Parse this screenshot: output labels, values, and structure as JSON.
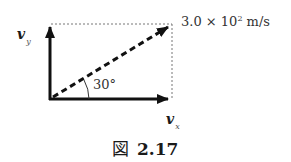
{
  "figure": {
    "caption_prefix": "図",
    "caption_number": "2.17",
    "labels": {
      "vy_symbol": "v",
      "vy_subscript": "y",
      "vx_symbol": "v",
      "vx_subscript": "x",
      "angle": "30°",
      "magnitude_mantissa": "3.0 × 10",
      "magnitude_exponent": "2",
      "magnitude_unit": " m/s"
    },
    "vectors": [
      {
        "name": "v",
        "magnitude": "3.0×10² m/s",
        "angle_deg": 30,
        "style": "dashed"
      },
      {
        "name": "v_x",
        "style": "solid"
      },
      {
        "name": "v_y",
        "style": "solid"
      }
    ]
  }
}
